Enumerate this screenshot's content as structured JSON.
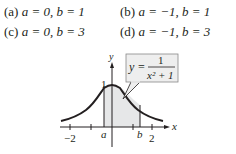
{
  "options": [
    {
      "label": "(a)",
      "text": "a = 0, b = 1"
    },
    {
      "label": "(b)",
      "text": "a = −1, b = 1"
    },
    {
      "label": "(c)",
      "text": "a = 0, b = 3"
    },
    {
      "label": "(d)",
      "text": "a = −1, b = 3"
    }
  ],
  "graph": {
    "function_label": "y =",
    "numerator": "1",
    "denominator": "x² + 1",
    "axis_x_label": "x",
    "axis_y_label": "y",
    "y_tick_label": "1",
    "x_tick_labels": [
      "−2",
      "2"
    ],
    "a_label": "a",
    "b_label": "b",
    "colors": {
      "curve": "#231f20",
      "shade": "#e6e7e8",
      "box": "#eeeeee"
    }
  }
}
